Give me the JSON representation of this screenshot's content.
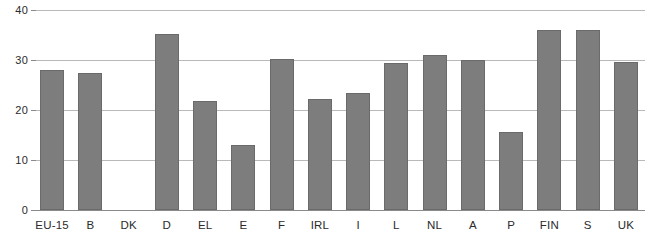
{
  "chart_data": {
    "type": "bar",
    "title": "",
    "subtitle": "",
    "xlabel": "",
    "ylabel": "",
    "categories": [
      "EU-15",
      "B",
      "DK",
      "D",
      "EL",
      "E",
      "F",
      "IRL",
      "I",
      "L",
      "NL",
      "A",
      "P",
      "FIN",
      "S",
      "UK"
    ],
    "values": [
      28.0,
      27.4,
      null,
      35.2,
      21.8,
      13.0,
      30.3,
      22.3,
      23.4,
      29.4,
      31.0,
      30.1,
      15.6,
      36.0,
      36.0,
      29.6
    ],
    "ylim": [
      0,
      40
    ],
    "yticks": [
      0,
      10,
      20,
      30,
      40
    ],
    "ytick_labels": [
      "0",
      "10",
      "20",
      "30",
      "40"
    ],
    "grid": true,
    "grid_axis": "y",
    "legend": false,
    "legend_position": "none",
    "bar_color": "#7d7d7d",
    "bar_border_color": "#6a6a6a",
    "gridline_color": "#b9b9b9",
    "axis_color": "#8a8a8a",
    "text_color": "#2b2b2b",
    "background_color": "#ffffff",
    "missing_categories": [
      "DK"
    ]
  }
}
